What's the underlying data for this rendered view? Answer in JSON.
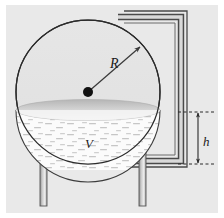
{
  "figure": {
    "canvas": {
      "width": 224,
      "height": 218
    },
    "background_color": "#e9e9e9",
    "margin_color": "#ffffff",
    "outline_color": "#2b2b2b"
  },
  "labels": {
    "radius": "R",
    "volume": "V",
    "height": "h"
  },
  "sphere": {
    "name": "spherical-tank",
    "center_x": 88,
    "center_y": 92,
    "radius": 72,
    "fill_color": "#e4e4e4",
    "stroke_color": "#2b2b2b"
  },
  "liquid": {
    "name": "liquid-body",
    "surface_y": 110,
    "fill_color": "#fbfbfb",
    "surface_top_color": "#b9b9b9",
    "surface_bottom_color": "#ededed",
    "texture_color": "#c9c9c9"
  },
  "center_point": {
    "name": "sphere-center-dot",
    "x": 88,
    "y": 92,
    "radius": 5,
    "color": "#111111"
  },
  "radius_arrow": {
    "name": "radius-dimension-arrow",
    "from_x": 88,
    "from_y": 92,
    "to_x": 140,
    "to_y": 47,
    "label_x": 113,
    "label_y": 64,
    "color": "#3a3a3a"
  },
  "legs": [
    {
      "name": "support-leg-left",
      "x": 40,
      "top": 118,
      "bottom": 205,
      "width": 7
    },
    {
      "name": "support-leg-right",
      "x": 139,
      "top": 118,
      "bottom": 205,
      "width": 7
    }
  ],
  "leg_style": {
    "fill_color": "#b4b4b4",
    "highlight_color": "#e6e6e6",
    "stroke_color": "#555555"
  },
  "pipe": {
    "name": "outlet-pipe",
    "stroke_color": "#4a4a4a",
    "inner_color": "#d6d6d6",
    "thickness": 5,
    "top_y": 15,
    "right_x": 184,
    "bottom_y": 163,
    "left_x": 118
  },
  "height_dimension": {
    "name": "liquid-height-dimension",
    "x": 205,
    "top_y": 112,
    "bottom_y": 164,
    "label_x": 210,
    "label_y": 141,
    "extension_left_x": 178,
    "dash_color": "#2b2b2b",
    "line_color": "#2b2b2b"
  }
}
